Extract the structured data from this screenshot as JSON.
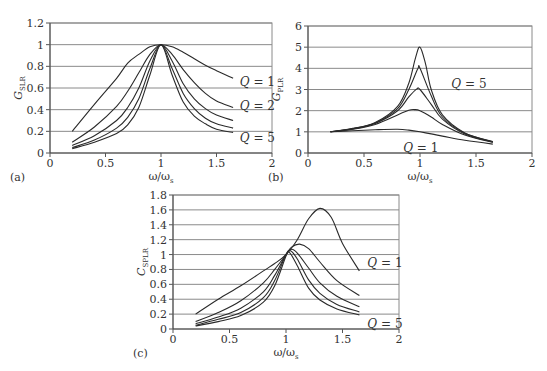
{
  "chart_data": [
    {
      "id": "a",
      "panel_label": "(a)",
      "type": "line",
      "xlabel": "ω/ω",
      "xlabel_sub": "s",
      "ylabel": "G",
      "ylabel_sub": "SLR",
      "xlim": [
        0,
        2
      ],
      "ylim": [
        0,
        1.2
      ],
      "xticks": [
        "0",
        "0.5",
        "1",
        "1.5",
        "2"
      ],
      "yticks": [
        "0",
        "0.2",
        "0.4",
        "0.6",
        "0.8",
        "1",
        "1.2"
      ],
      "grid": "horizontal",
      "px": {
        "x0": 50,
        "x1": 272,
        "y0": 153,
        "y1": 23,
        "ymax": 1.2,
        "ystep": 0.2
      },
      "annotations": [
        {
          "text": "Q = 1",
          "x": 1.71,
          "y": 0.66
        },
        {
          "text": "Q = 2",
          "x": 1.71,
          "y": 0.43
        },
        {
          "text": "Q = 5",
          "x": 1.71,
          "y": 0.14
        }
      ],
      "series": [
        {
          "name": "Q = 1",
          "x": [
            0.2,
            0.4,
            0.6,
            0.7,
            0.8,
            0.9,
            1.0,
            1.1,
            1.2,
            1.3,
            1.4,
            1.5,
            1.65
          ],
          "values": [
            0.2,
            0.45,
            0.69,
            0.83,
            0.91,
            0.98,
            1.0,
            0.98,
            0.93,
            0.87,
            0.81,
            0.76,
            0.69
          ]
        },
        {
          "name": "Q = 2",
          "x": [
            0.2,
            0.4,
            0.6,
            0.7,
            0.8,
            0.9,
            1.0,
            1.1,
            1.2,
            1.3,
            1.4,
            1.5,
            1.65
          ],
          "values": [
            0.1,
            0.24,
            0.43,
            0.57,
            0.74,
            0.91,
            1.0,
            0.91,
            0.77,
            0.65,
            0.55,
            0.48,
            0.42
          ]
        },
        {
          "name": "Q = 3",
          "x": [
            0.2,
            0.4,
            0.6,
            0.7,
            0.8,
            0.9,
            1.0,
            1.1,
            1.2,
            1.3,
            1.4,
            1.5,
            1.65
          ],
          "values": [
            0.07,
            0.16,
            0.3,
            0.42,
            0.6,
            0.85,
            1.0,
            0.85,
            0.64,
            0.5,
            0.41,
            0.35,
            0.3
          ]
        },
        {
          "name": "Q = 4",
          "x": [
            0.2,
            0.4,
            0.6,
            0.7,
            0.8,
            0.9,
            1.0,
            1.1,
            1.2,
            1.3,
            1.4,
            1.5,
            1.65
          ],
          "values": [
            0.05,
            0.12,
            0.23,
            0.33,
            0.5,
            0.78,
            1.0,
            0.78,
            0.55,
            0.41,
            0.32,
            0.27,
            0.23
          ]
        },
        {
          "name": "Q = 5",
          "x": [
            0.2,
            0.4,
            0.6,
            0.7,
            0.8,
            0.9,
            1.0,
            1.1,
            1.2,
            1.3,
            1.4,
            1.5,
            1.65
          ],
          "values": [
            0.04,
            0.1,
            0.18,
            0.26,
            0.42,
            0.72,
            1.0,
            0.72,
            0.47,
            0.34,
            0.27,
            0.22,
            0.19
          ]
        }
      ]
    },
    {
      "id": "b",
      "panel_label": "(b)",
      "type": "line",
      "xlabel": "ω/ω",
      "xlabel_sub": "s",
      "ylabel": "G",
      "ylabel_sub": "PLR",
      "xlim": [
        0,
        2
      ],
      "ylim": [
        0,
        6
      ],
      "xticks": [
        "0",
        "0.5",
        "1",
        "1.5",
        "2"
      ],
      "yticks": [
        "0",
        "1",
        "2",
        "3",
        "4",
        "5",
        "6"
      ],
      "grid": "horizontal",
      "px": {
        "x0": 308,
        "x1": 532,
        "y0": 153,
        "y1": 26,
        "ymax": 6,
        "ystep": 1
      },
      "annotations": [
        {
          "text": "Q = 5",
          "x": 1.28,
          "y": 3.25
        },
        {
          "text": "Q = 1",
          "x": 0.85,
          "y": 0.25
        }
      ],
      "series": [
        {
          "name": "Q = 1",
          "x": [
            0.2,
            0.4,
            0.6,
            0.8,
            0.9,
            1.0,
            1.1,
            1.2,
            1.4,
            1.65
          ],
          "values": [
            1.0,
            1.05,
            1.1,
            1.12,
            1.08,
            1.0,
            0.9,
            0.8,
            0.6,
            0.42
          ]
        },
        {
          "name": "Q = 2",
          "x": [
            0.2,
            0.4,
            0.6,
            0.8,
            0.9,
            0.95,
            1.0,
            1.1,
            1.2,
            1.4,
            1.65
          ],
          "values": [
            1.0,
            1.12,
            1.35,
            1.8,
            2.02,
            2.05,
            2.0,
            1.7,
            1.35,
            0.85,
            0.5
          ]
        },
        {
          "name": "Q = 3",
          "x": [
            0.2,
            0.4,
            0.6,
            0.8,
            0.9,
            0.97,
            1.0,
            1.1,
            1.2,
            1.4,
            1.65
          ],
          "values": [
            1.0,
            1.14,
            1.4,
            2.0,
            2.65,
            3.02,
            3.0,
            2.3,
            1.6,
            0.9,
            0.52
          ]
        },
        {
          "name": "Q = 4",
          "x": [
            0.2,
            0.4,
            0.6,
            0.8,
            0.9,
            0.98,
            1.0,
            1.1,
            1.2,
            1.4,
            1.65
          ],
          "values": [
            1.0,
            1.15,
            1.42,
            2.1,
            3.0,
            3.98,
            4.0,
            2.7,
            1.7,
            0.93,
            0.53
          ]
        },
        {
          "name": "Q = 5",
          "x": [
            0.2,
            0.4,
            0.6,
            0.8,
            0.9,
            0.96,
            1.0,
            1.05,
            1.1,
            1.2,
            1.4,
            1.65
          ],
          "values": [
            1.0,
            1.16,
            1.44,
            2.2,
            3.3,
            4.5,
            5.0,
            4.2,
            3.0,
            1.8,
            0.95,
            0.54
          ]
        }
      ]
    },
    {
      "id": "c",
      "panel_label": "(c)",
      "type": "line",
      "xlabel": "ω/ω",
      "xlabel_sub": "s",
      "ylabel": "C",
      "ylabel_sub": "SPLR",
      "xlim": [
        0,
        2
      ],
      "ylim": [
        0,
        1.8
      ],
      "xticks": [
        "0",
        "0.5",
        "1",
        "1.5",
        "2"
      ],
      "yticks": [
        "0",
        "0.2",
        "0.4",
        "0.6",
        "0.8",
        "1",
        "1.2",
        "1.4",
        "1.6",
        "1.8"
      ],
      "grid": "horizontal",
      "px": {
        "x0": 173,
        "x1": 399,
        "y0": 329,
        "y1": 195,
        "ymax": 1.8,
        "ystep": 0.2
      },
      "annotations": [
        {
          "text": "Q = 1",
          "x": 1.72,
          "y": 0.88
        },
        {
          "text": "Q = 5",
          "x": 1.72,
          "y": 0.07
        }
      ],
      "series": [
        {
          "name": "Q = 1",
          "x": [
            0.2,
            0.4,
            0.6,
            0.8,
            0.9,
            1.0,
            1.1,
            1.2,
            1.3,
            1.4,
            1.5,
            1.65
          ],
          "values": [
            0.2,
            0.4,
            0.58,
            0.78,
            0.88,
            1.0,
            1.2,
            1.48,
            1.62,
            1.5,
            1.15,
            0.78
          ]
        },
        {
          "name": "Q = 2",
          "x": [
            0.2,
            0.4,
            0.6,
            0.8,
            0.9,
            1.0,
            1.05,
            1.12,
            1.2,
            1.3,
            1.45,
            1.65
          ],
          "values": [
            0.1,
            0.22,
            0.38,
            0.62,
            0.8,
            1.0,
            1.1,
            1.14,
            1.08,
            0.9,
            0.65,
            0.45
          ]
        },
        {
          "name": "Q = 3",
          "x": [
            0.2,
            0.4,
            0.6,
            0.8,
            0.9,
            1.0,
            1.05,
            1.1,
            1.2,
            1.3,
            1.45,
            1.65
          ],
          "values": [
            0.07,
            0.16,
            0.28,
            0.5,
            0.72,
            1.0,
            1.07,
            1.02,
            0.82,
            0.62,
            0.44,
            0.3
          ]
        },
        {
          "name": "Q = 4",
          "x": [
            0.2,
            0.4,
            0.6,
            0.8,
            0.9,
            1.0,
            1.04,
            1.1,
            1.2,
            1.3,
            1.45,
            1.65
          ],
          "values": [
            0.05,
            0.13,
            0.22,
            0.42,
            0.65,
            1.0,
            1.05,
            0.94,
            0.66,
            0.48,
            0.33,
            0.23
          ]
        },
        {
          "name": "Q = 5",
          "x": [
            0.2,
            0.4,
            0.6,
            0.8,
            0.9,
            1.0,
            1.03,
            1.1,
            1.2,
            1.3,
            1.45,
            1.65
          ],
          "values": [
            0.04,
            0.1,
            0.18,
            0.36,
            0.58,
            0.98,
            1.03,
            0.85,
            0.55,
            0.39,
            0.27,
            0.19
          ]
        }
      ]
    }
  ]
}
